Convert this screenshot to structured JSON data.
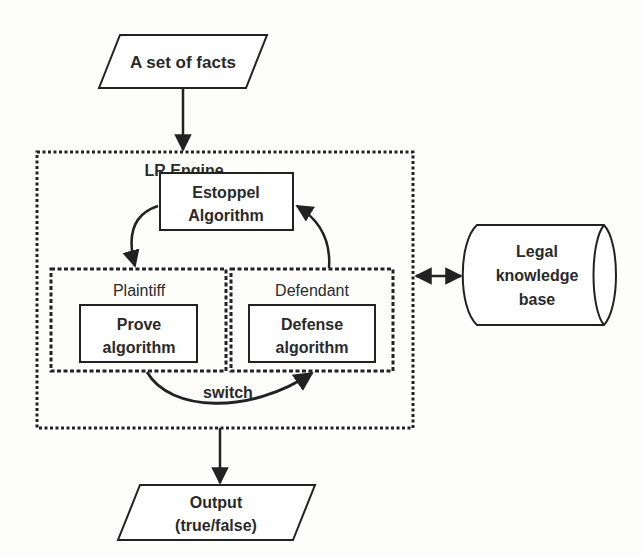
{
  "diagram": {
    "input": {
      "label": "A set of facts",
      "shape": "parallelogram"
    },
    "engine": {
      "title": "LR Engine",
      "estoppel": {
        "line1": "Estoppel",
        "line2": "Algorithm"
      },
      "plaintiff": {
        "title": "Plaintiff",
        "box": {
          "line1": "Prove",
          "line2": "algorithm"
        }
      },
      "defendant": {
        "title": "Defendant",
        "box": {
          "line1": "Defense",
          "line2": "algorithm"
        }
      },
      "switch_label": "switch"
    },
    "knowledge_base": {
      "line1": "Legal",
      "line2": "knowledge",
      "line3": "base",
      "shape": "cylinder"
    },
    "output": {
      "line1": "Output",
      "line2": "(true/false)",
      "shape": "parallelogram"
    },
    "colors": {
      "stroke": "#222222",
      "background": "#fdfdfc"
    }
  }
}
